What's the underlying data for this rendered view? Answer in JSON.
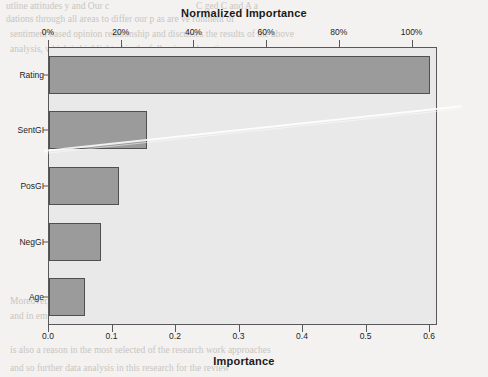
{
  "figure": {
    "top_axis_title": "Normalized Importance",
    "bottom_axis_title": "Importance",
    "colors": {
      "bar_fill": "#9b9b9b",
      "bar_stroke": "#4f4f51",
      "plot_background": "#e9e9e9",
      "axis": "#58585a",
      "page_background": "#f3f2f0"
    }
  },
  "chart_data": {
    "type": "bar",
    "orientation": "horizontal",
    "title": "",
    "categories": [
      "Rating",
      "SentGI",
      "PosGI",
      "NegGI",
      "Age"
    ],
    "values": [
      0.6,
      0.155,
      0.11,
      0.082,
      0.057
    ],
    "normalized_values": [
      100,
      25.8,
      18.3,
      13.7,
      9.5
    ],
    "xlabel": "Importance",
    "ylabel": "",
    "xlim": [
      0.0,
      0.6125
    ],
    "grid": false,
    "legend": null,
    "secondary_x_axis": {
      "label": "Normalized Importance",
      "ticks": [
        "0%",
        "20%",
        "40%",
        "60%",
        "80%",
        "100%"
      ],
      "tick_values": [
        0,
        20,
        40,
        60,
        80,
        100
      ],
      "lim": [
        0,
        107
      ]
    },
    "primary_x_axis": {
      "ticks": [
        "0.0",
        "0.1",
        "0.2",
        "0.3",
        "0.4",
        "0.5",
        "0.6"
      ],
      "tick_values": [
        0.0,
        0.1,
        0.2,
        0.3,
        0.4,
        0.5,
        0.6
      ]
    }
  },
  "page_bleed": {
    "lines": [
      {
        "t": "utline   attitudes  y and  Our c",
        "x": 6,
        "y": 1,
        "s": 9.5,
        "w": "normal"
      },
      {
        "t": "C   ged  C  and   A  a",
        "x": 196,
        "y": 1,
        "s": 9.5,
        "w": "normal"
      },
      {
        "t": "dations  through  all  areas  to differ our p    as  are    ve  ronment  of",
        "x": 6,
        "y": 14,
        "s": 9.5,
        "w": "normal"
      },
      {
        "t": "sentiment  based  opinion  relationship  and  discusses  the  results  of  the  above",
        "x": 10,
        "y": 29,
        "s": 9.5,
        "w": "normal"
      },
      {
        "t": "analysis,  which  is    highlighted  in  the  following  subsections.",
        "x": 10,
        "y": 44,
        "s": 9.5,
        "w": "normal"
      },
      {
        "t": "6.1  Limitations and Future Research",
        "x": 136,
        "y": 127,
        "s": 11,
        "w": "bold"
      },
      {
        "t": "This paper has a  limitation  relating  to  its  economic  and  social  research",
        "x": 136,
        "y": 152,
        "s": 9.5,
        "w": "normal"
      },
      {
        "t": "orientation  and  for  the  definitive  structures  as  limited  for  the  sampling",
        "x": 136,
        "y": 167,
        "s": 9.5,
        "w": "normal"
      },
      {
        "t": "methodology  for  some  important  and  general  opinion  classification  as",
        "x": 136,
        "y": 182,
        "s": 9.5,
        "w": "normal"
      },
      {
        "t": "future  work.  By  contrast  that  the  sentiment  scope  of  this  most",
        "x": 136,
        "y": 197,
        "s": 9.5,
        "w": "normal"
      },
      {
        "t": "domain-constrained  data  in  applications  are  covering  involvement  of",
        "x": 136,
        "y": 212,
        "s": 9.5,
        "w": "normal"
      },
      {
        "t": "resultant  environment  constructions  that  forms  for  better  implementing",
        "x": 136,
        "y": 227,
        "s": 9.5,
        "w": "normal"
      },
      {
        "t": "prediction  would  be  relevant  for  one  or  the  conditions  and  its  form",
        "x": 136,
        "y": 242,
        "s": 9.5,
        "w": "normal"
      },
      {
        "t": "one  might  be  the  basis  of  our  findings.",
        "x": 136,
        "y": 257,
        "s": 9.5,
        "w": "normal"
      },
      {
        "t": "Moreover,  the  sentiment  analysis  that  could  be  limited  for  its  constructs",
        "x": 10,
        "y": 296,
        "s": 9.5,
        "w": "normal"
      },
      {
        "t": "and  in  emotional  research  of  the  social  economics",
        "x": 10,
        "y": 311,
        "s": 9.5,
        "w": "normal"
      },
      {
        "t": "is  also  a  reason  in  the  most  selected  of  the  research  work  approaches",
        "x": 10,
        "y": 345,
        "s": 9.5,
        "w": "normal"
      },
      {
        "t": "and  so  further  data  analysis  in  this  research  for  the  review",
        "x": 10,
        "y": 363,
        "s": 9.5,
        "w": "normal"
      }
    ]
  }
}
